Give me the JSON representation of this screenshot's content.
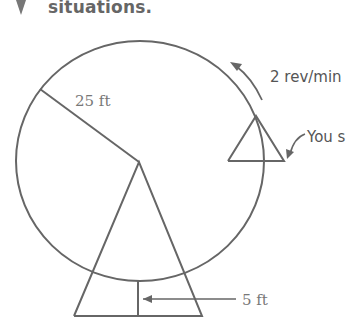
{
  "heading": {
    "text": "situations."
  },
  "diagram": {
    "radius_label": "25 ft",
    "speed_label": "2 rev/min",
    "you_label": "You s",
    "height_label": "5 ft",
    "stroke_color": "#666666"
  }
}
